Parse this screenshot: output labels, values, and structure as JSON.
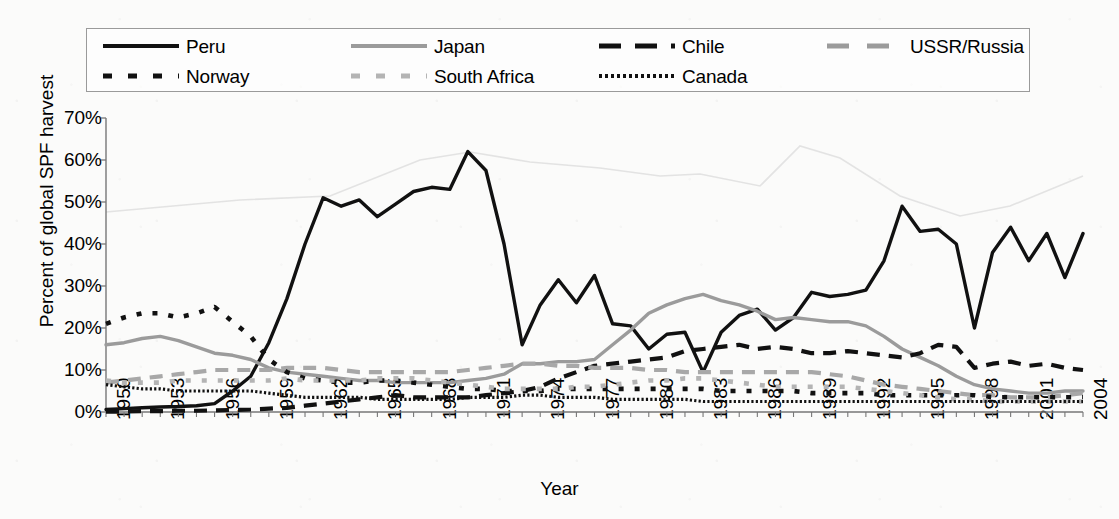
{
  "chart_data": {
    "type": "line",
    "title": "",
    "xlabel": "Year",
    "ylabel": "Percent of global SPF harvest",
    "xlim": [
      1950,
      2004
    ],
    "ylim": [
      0,
      70
    ],
    "ytick_labels": [
      "0%",
      "10%",
      "20%",
      "30%",
      "40%",
      "50%",
      "60%",
      "70%"
    ],
    "ytick_values": [
      0,
      10,
      20,
      30,
      40,
      50,
      60,
      70
    ],
    "xtick_labels": [
      "1950",
      "1953",
      "1956",
      "1959",
      "1962",
      "1965",
      "1968",
      "1971",
      "1974",
      "1977",
      "1980",
      "1983",
      "1986",
      "1989",
      "1992",
      "1995",
      "1998",
      "2001",
      "2004"
    ],
    "xtick_values": [
      1950,
      1953,
      1956,
      1959,
      1962,
      1965,
      1968,
      1971,
      1974,
      1977,
      1980,
      1983,
      1986,
      1989,
      1992,
      1995,
      1998,
      2001,
      2004
    ],
    "grid": false,
    "legend_position": "top",
    "x": [
      1950,
      1951,
      1952,
      1953,
      1954,
      1955,
      1956,
      1957,
      1958,
      1959,
      1960,
      1961,
      1962,
      1963,
      1964,
      1965,
      1966,
      1967,
      1968,
      1969,
      1970,
      1971,
      1972,
      1973,
      1974,
      1975,
      1976,
      1977,
      1978,
      1979,
      1980,
      1981,
      1982,
      1983,
      1984,
      1985,
      1986,
      1987,
      1988,
      1989,
      1990,
      1991,
      1992,
      1993,
      1994,
      1995,
      1996,
      1997,
      1998,
      1999,
      2000,
      2001,
      2002,
      2003,
      2004
    ],
    "series": [
      {
        "name": "Peru",
        "style": "solid",
        "color": "#111111",
        "values": [
          0.6,
          0.8,
          1.0,
          1.2,
          1.3,
          1.5,
          2.0,
          5.0,
          8.5,
          16.5,
          27.0,
          40.0,
          51.0,
          49.0,
          50.5,
          46.5,
          49.5,
          52.5,
          53.5,
          53.0,
          62.0,
          57.5,
          40.0,
          16.0,
          25.5,
          31.5,
          26.0,
          32.5,
          21.0,
          20.5,
          15.0,
          18.5,
          19.0,
          9.5,
          19.0,
          23.0,
          24.5,
          19.5,
          22.5,
          28.5,
          27.5,
          28.0,
          29.0,
          36.0,
          49.0,
          43.0,
          43.5,
          40.0,
          20.0,
          38.0,
          44.0,
          36.0,
          42.5,
          32.0,
          42.5
        ]
      },
      {
        "name": "Japan",
        "style": "solid",
        "color": "#9b9b9b",
        "values": [
          16.0,
          16.5,
          17.5,
          18.0,
          17.0,
          15.5,
          14.0,
          13.5,
          12.5,
          10.5,
          9.5,
          9.0,
          8.5,
          8.0,
          7.5,
          7.5,
          7.0,
          7.0,
          7.0,
          7.0,
          7.5,
          8.0,
          9.0,
          11.5,
          11.5,
          12.0,
          12.0,
          12.5,
          16.0,
          19.5,
          23.5,
          25.5,
          27.0,
          28.0,
          26.5,
          25.5,
          24.0,
          22.0,
          22.5,
          22.0,
          21.5,
          21.5,
          20.5,
          18.0,
          15.0,
          13.0,
          11.0,
          8.5,
          6.5,
          5.5,
          5.0,
          4.5,
          4.5,
          5.0,
          5.0
        ]
      },
      {
        "name": "Chile",
        "style": "dashed",
        "color": "#111111",
        "values": [
          0.1,
          0.1,
          0.2,
          0.2,
          0.3,
          0.3,
          0.4,
          0.5,
          0.6,
          0.8,
          1.0,
          1.5,
          2.0,
          2.5,
          3.0,
          3.5,
          4.0,
          3.5,
          3.5,
          3.5,
          3.5,
          4.0,
          4.5,
          5.0,
          6.0,
          8.0,
          9.5,
          11.0,
          11.5,
          12.0,
          12.5,
          13.0,
          14.5,
          15.0,
          15.5,
          16.0,
          15.0,
          15.5,
          15.0,
          14.0,
          14.0,
          14.5,
          14.0,
          13.5,
          13.0,
          14.0,
          16.0,
          15.5,
          10.5,
          11.5,
          12.0,
          11.0,
          11.5,
          10.5,
          10.0
        ]
      },
      {
        "name": "USSR/Russia",
        "style": "dashed",
        "color": "#a8a8a8",
        "values": [
          7.0,
          7.5,
          8.0,
          8.5,
          9.0,
          9.5,
          10.0,
          10.0,
          10.0,
          10.0,
          10.5,
          10.5,
          10.5,
          10.0,
          9.5,
          9.5,
          9.5,
          9.5,
          9.5,
          9.5,
          10.0,
          10.5,
          11.0,
          11.5,
          11.5,
          11.0,
          11.0,
          10.5,
          10.5,
          10.5,
          10.0,
          10.0,
          9.5,
          9.5,
          9.5,
          9.5,
          9.5,
          9.5,
          9.5,
          9.5,
          9.0,
          8.5,
          7.5,
          6.5,
          6.0,
          5.5,
          5.0,
          4.5,
          4.0,
          4.0,
          3.5,
          3.5,
          3.5,
          4.0,
          4.5
        ]
      },
      {
        "name": "Norway",
        "style": "dotted",
        "color": "#111111",
        "values": [
          21.0,
          22.5,
          23.5,
          23.5,
          22.5,
          23.5,
          25.0,
          21.5,
          18.0,
          12.5,
          9.5,
          8.0,
          7.5,
          7.0,
          7.0,
          7.5,
          7.5,
          7.0,
          6.5,
          6.0,
          5.5,
          5.5,
          5.0,
          5.0,
          5.0,
          5.5,
          5.5,
          5.5,
          5.5,
          5.5,
          5.5,
          5.5,
          5.5,
          5.5,
          5.0,
          5.0,
          5.0,
          5.0,
          5.0,
          4.5,
          4.5,
          4.5,
          4.5,
          4.0,
          4.0,
          4.0,
          4.0,
          4.0,
          4.0,
          3.5,
          3.5,
          3.5,
          3.5,
          3.5,
          3.5
        ]
      },
      {
        "name": "South Africa",
        "style": "dotted",
        "color": "#b4b4b4",
        "values": [
          7.5,
          7.0,
          7.0,
          7.0,
          7.5,
          7.5,
          7.5,
          7.5,
          7.5,
          7.5,
          8.0,
          7.5,
          7.5,
          7.5,
          7.5,
          8.0,
          8.0,
          8.0,
          7.5,
          7.0,
          6.5,
          6.0,
          5.5,
          5.5,
          5.5,
          5.5,
          6.0,
          6.0,
          6.5,
          7.0,
          7.5,
          7.5,
          8.0,
          8.0,
          7.5,
          7.0,
          6.5,
          6.0,
          6.0,
          6.0,
          6.0,
          6.0,
          5.5,
          5.0,
          4.5,
          4.0,
          3.5,
          3.0,
          3.0,
          2.5,
          2.5,
          2.5,
          2.5,
          2.5,
          2.5
        ]
      },
      {
        "name": "Canada",
        "style": "fine-dotted",
        "color": "#111111",
        "values": [
          6.5,
          6.0,
          5.5,
          5.5,
          5.0,
          5.0,
          5.0,
          5.0,
          5.0,
          4.5,
          4.0,
          3.5,
          3.5,
          3.5,
          3.5,
          3.0,
          3.0,
          3.0,
          3.0,
          3.0,
          3.5,
          3.5,
          3.5,
          4.0,
          4.0,
          3.5,
          3.5,
          3.5,
          3.0,
          3.0,
          3.0,
          3.0,
          3.0,
          2.5,
          2.5,
          2.5,
          2.5,
          2.5,
          2.5,
          2.5,
          2.5,
          2.5,
          2.5,
          2.5,
          2.5,
          2.5,
          2.5,
          2.5,
          2.5,
          2.5,
          2.5,
          2.5,
          2.5,
          2.5,
          2.5
        ]
      }
    ]
  },
  "legend": {
    "items": [
      {
        "label": "Peru",
        "swatch": "sw-solid-dark",
        "icon": "line-swatch-solid-dark-icon"
      },
      {
        "label": "Japan",
        "swatch": "sw-solid-gray",
        "icon": "line-swatch-solid-gray-icon"
      },
      {
        "label": "Chile",
        "swatch": "sw-dash-dark",
        "icon": "line-swatch-dashed-dark-icon"
      },
      {
        "label": "USSR/Russia",
        "swatch": "sw-dash-gray",
        "icon": "line-swatch-dashed-gray-icon"
      },
      {
        "label": "Norway",
        "swatch": "sw-dot-dark",
        "icon": "line-swatch-dotted-dark-icon"
      },
      {
        "label": "South Africa",
        "swatch": "sw-dot-gray",
        "icon": "line-swatch-dotted-gray-icon"
      },
      {
        "label": "Canada",
        "swatch": "sw-fine-dark",
        "icon": "line-swatch-fine-dotted-dark-icon"
      }
    ]
  },
  "axes": {
    "y_title": "Percent of global SPF harvest",
    "x_title": "Year"
  }
}
